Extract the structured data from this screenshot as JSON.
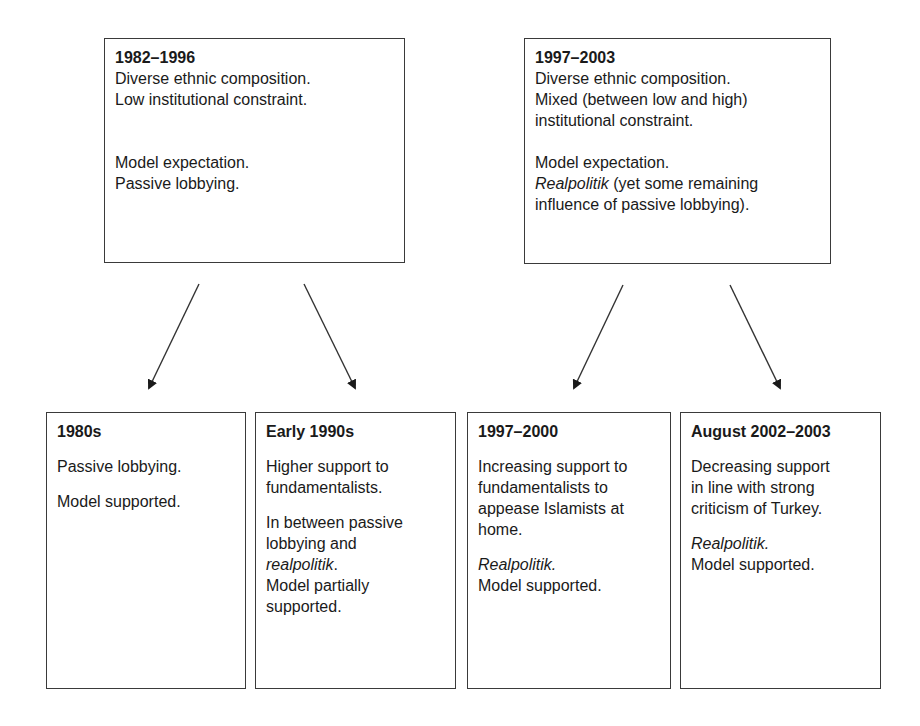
{
  "diagram": {
    "top_boxes": [
      {
        "title": "1982–1996",
        "lines": [
          "Diverse ethnic composition.",
          "Low institutional constraint."
        ],
        "expectation_label": "Model expectation.",
        "expectation_value": "Passive lobbying."
      },
      {
        "title": "1997–2003",
        "lines": [
          "Diverse ethnic composition.",
          "Mixed (between low and high)",
          "institutional constraint."
        ],
        "expectation_label": "Model expectation.",
        "expectation_italic": "Realpolitik",
        "expectation_rest_1": " (yet some remaining",
        "expectation_rest_2": "influence of passive lobbying)."
      }
    ],
    "bottom_boxes": [
      {
        "title": "1980s",
        "desc": [
          "Passive lobbying."
        ],
        "verdict": "Model supported."
      },
      {
        "title": "Early 1990s",
        "desc": [
          "Higher support to",
          "fundamentalists."
        ],
        "mix_1": "In between passive",
        "mix_2": "lobbying and",
        "mix_italic": "realpolitik",
        "mix_end": ".",
        "verdict_1": "Model partially",
        "verdict_2": "supported."
      },
      {
        "title": "1997–2000",
        "desc": [
          "Increasing support to",
          "fundamentalists to",
          "appease Islamists at",
          "home."
        ],
        "italic": "Realpolitik.",
        "verdict": "Model supported."
      },
      {
        "title": "August 2002–2003",
        "desc": [
          "Decreasing support",
          "in line with strong",
          "criticism of Turkey."
        ],
        "italic": "Realpolitik.",
        "verdict": "Model supported."
      }
    ],
    "arrows": [
      {
        "from": "1982–1996",
        "to": "1980s"
      },
      {
        "from": "1982–1996",
        "to": "Early 1990s"
      },
      {
        "from": "1997–2003",
        "to": "1997–2000"
      },
      {
        "from": "1997–2003",
        "to": "August 2002–2003"
      }
    ]
  }
}
